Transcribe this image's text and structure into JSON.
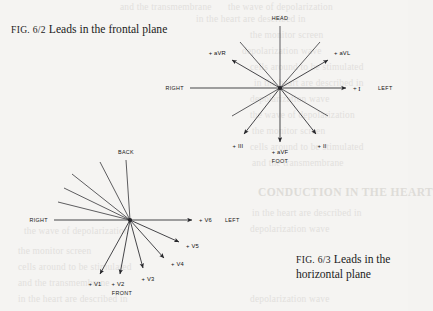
{
  "page": {
    "background_color": "#f5f4f2",
    "ink_color": "#1b1b1b"
  },
  "captions": {
    "fig_62": {
      "label": "Fig. 6/2",
      "text": "Leads in the frontal plane",
      "full": "Fig. 6/2 Leads in the frontal plane"
    },
    "fig_63": {
      "label": "Fig. 6/3",
      "text": "Leads in the horizontal plane",
      "full": "Fig. 6/3 Leads in the horizontal plane"
    }
  },
  "frontal_plane": {
    "title": "Leads in the frontal plane",
    "orientation_labels": {
      "top": "HEAD",
      "bottom": "FOOT",
      "left": "RIGHT",
      "right": "LEFT"
    },
    "leads": [
      {
        "name": "+ aVR",
        "angle_deg": -150,
        "label": "+ aVR"
      },
      {
        "name": "+ aVL",
        "angle_deg": -30,
        "label": "+ aVL"
      },
      {
        "name": "+ I",
        "angle_deg": 0,
        "label": "+ I"
      },
      {
        "name": "+ II",
        "angle_deg": 60,
        "label": "+ II"
      },
      {
        "name": "+ aVF",
        "angle_deg": 90,
        "label": "+ aVF"
      },
      {
        "name": "+ III",
        "angle_deg": 120,
        "label": "+ III"
      }
    ]
  },
  "horizontal_plane": {
    "title": "Leads in the horizontal plane",
    "orientation_labels": {
      "top": "BACK",
      "bottom": "FRONT",
      "left": "RIGHT",
      "right": "LEFT"
    },
    "leads": [
      {
        "name": "+ V1",
        "label": "+ V1"
      },
      {
        "name": "+ V2",
        "label": "+ V2"
      },
      {
        "name": "+ V3",
        "label": "+ V3"
      },
      {
        "name": "+ V4",
        "label": "+ V4"
      },
      {
        "name": "+ V5",
        "label": "+ V5"
      },
      {
        "name": "+ V6",
        "label": "+ V6"
      }
    ]
  },
  "showthrough": {
    "heading": "CONDUCTION IN THE HEART",
    "lines": [
      "in the heart are described in",
      "the monitor screen",
      "depolarization wave",
      "and the transmembrane",
      "the wave of depolarization",
      "cells around to be stimulated"
    ]
  }
}
